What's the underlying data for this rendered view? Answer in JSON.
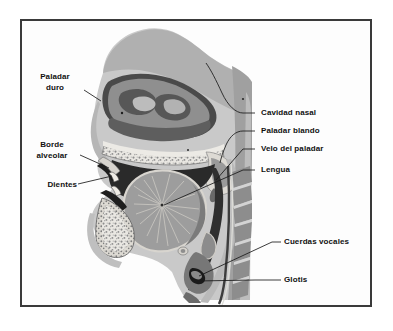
{
  "figure": {
    "title_visible": false,
    "type": "anatomical-diagram",
    "language": "es",
    "style": "grayscale halftone illustration with black leader lines",
    "frame": {
      "border_color": "#3a3a3a",
      "background": "#fdfdfd"
    },
    "palette": {
      "page_background": "#ffffff",
      "ink": "#111111",
      "leader_line": "#1a1a1a",
      "tone_lightest": "#e6e6e6",
      "tone_light": "#cfcfcf",
      "tone_mid_light": "#b4b4b4",
      "tone_mid": "#9a9a9a",
      "tone_mid_dark": "#7d7d7d",
      "tone_dark": "#5c5c5c",
      "tone_darkest": "#3a3a3a",
      "tone_black": "#1c1c1c",
      "cavity_white": "#f2f1ee"
    }
  },
  "labels": {
    "left": [
      {
        "id": "paladar-duro",
        "lines": [
          "Paladar",
          "duro"
        ]
      },
      {
        "id": "borde-alveolar",
        "lines": [
          "Borde",
          "alveolar"
        ]
      },
      {
        "id": "dientes",
        "lines": [
          "Dientes"
        ]
      }
    ],
    "right": [
      {
        "id": "cavidad-nasal",
        "lines": [
          "Cavidad nasal"
        ]
      },
      {
        "id": "paladar-blando",
        "lines": [
          "Paladar blando"
        ]
      },
      {
        "id": "velo-del-paladar",
        "lines": [
          "Velo del paladar"
        ]
      },
      {
        "id": "lengua",
        "lines": [
          "Lengua"
        ]
      },
      {
        "id": "cuerdas-vocales",
        "lines": [
          "Cuerdas vocales"
        ]
      },
      {
        "id": "glotis",
        "lines": [
          "Glotis"
        ]
      }
    ]
  }
}
